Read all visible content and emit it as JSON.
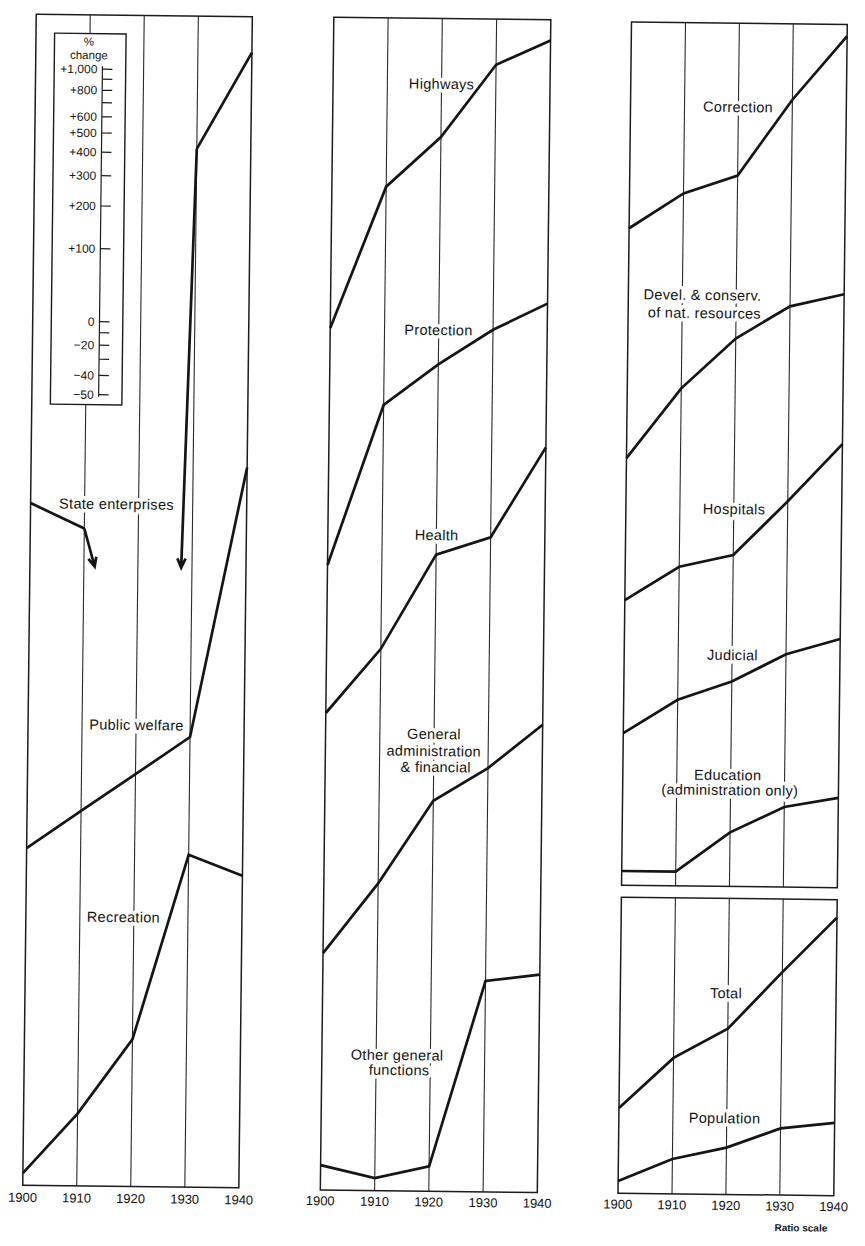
{
  "figure": {
    "ratio_scale_note": "Ratio scale",
    "percent_change_scale": {
      "symbol": "%",
      "title": "change",
      "ticks": [
        {
          "value": 1000,
          "label": "+1,000"
        },
        {
          "value": 900,
          "label": ""
        },
        {
          "value": 800,
          "label": "+800"
        },
        {
          "value": 700,
          "label": ""
        },
        {
          "value": 600,
          "label": "+600"
        },
        {
          "value": 500,
          "label": "+500"
        },
        {
          "value": 400,
          "label": "+400"
        },
        {
          "value": 300,
          "label": "+300"
        },
        {
          "value": 200,
          "label": "+200"
        },
        {
          "value": 100,
          "label": "+100"
        },
        {
          "value": 0,
          "label": "0"
        },
        {
          "value": -10,
          "label": ""
        },
        {
          "value": -20,
          "label": "−20"
        },
        {
          "value": -30,
          "label": ""
        },
        {
          "value": -40,
          "label": "−40"
        },
        {
          "value": -50,
          "label": "−50"
        }
      ]
    },
    "colors": {
      "ink": "#151515",
      "paper": "#ffffff"
    }
  },
  "chart_data": {
    "type": "line",
    "title": "",
    "x": [
      1900,
      1910,
      1920,
      1930,
      1940
    ],
    "x_tick_labels": [
      "1900",
      "1910",
      "1920",
      "1930",
      "1940"
    ],
    "xlabel": "",
    "ylabel": "% change",
    "y_scale": "ratio (logarithmic)",
    "y_unit": "relative level, 1900 = 100 (read from ratio scale)",
    "grid": true,
    "legend": "inline labels beside each line",
    "panels": [
      {
        "name": "left",
        "series": [
          {
            "name": "State enterprises",
            "label_lines": [
              "State enterprises"
            ],
            "values": [
              100,
              79,
              null,
              2940,
              7380
            ],
            "off_scale_below": [
              {
                "from": 1910,
                "toward": 1912
              },
              {
                "from": 1930,
                "toward": 1928
              }
            ]
          },
          {
            "name": "Public welfare",
            "label_lines": [
              "Public welfare"
            ],
            "values": [
              100,
              143,
              204,
              292,
              3800
            ]
          },
          {
            "name": "Recreation",
            "label_lines": [
              "Recreation"
            ],
            "values": [
              100,
              177,
              360,
              2090,
              1725
            ]
          }
        ]
      },
      {
        "name": "middle",
        "series": [
          {
            "name": "Highways",
            "label_lines": [
              "Highways"
            ],
            "values": [
              100,
              385,
              620,
              1240,
              1570
            ]
          },
          {
            "name": "Protection",
            "label_lines": [
              "Protection"
            ],
            "values": [
              100,
              460,
              680,
              950,
              1225
            ]
          },
          {
            "name": "Health",
            "label_lines": [
              "Health"
            ],
            "values": [
              100,
              185,
              455,
              540,
              1275
            ]
          },
          {
            "name": "General administration & financial",
            "label_lines": [
              "General",
              "administration",
              "& financial"
            ],
            "values": [
              100,
              195,
              430,
              590,
              895
            ]
          },
          {
            "name": "Other general functions",
            "label_lines": [
              "Other general",
              "functions"
            ],
            "values": [
              100,
              89,
              100,
              585,
              625
            ]
          }
        ]
      },
      {
        "name": "right-upper",
        "series": [
          {
            "name": "Correction",
            "label_lines": [
              "Correction"
            ],
            "values": [
              100,
              140,
              167,
              345,
              635
            ]
          },
          {
            "name": "Devel. & conserv. of nat. resources",
            "label_lines": [
              "Devel. & conserv.",
              "of nat. resources"
            ],
            "values": [
              100,
              195,
              315,
              430,
              485
            ]
          },
          {
            "name": "Hospitals",
            "label_lines": [
              "Hospitals"
            ],
            "values": [
              100,
              138,
              155,
              260,
              450
            ]
          },
          {
            "name": "Judicial",
            "label_lines": [
              "Judicial"
            ],
            "values": [
              100,
              138,
              165,
              215,
              250
            ]
          },
          {
            "name": "Education (administration only)",
            "label_lines": [
              "Education",
              "(administration only)"
            ],
            "values": [
              100,
              100,
              146,
              187,
              205
            ]
          }
        ]
      },
      {
        "name": "right-lower",
        "series": [
          {
            "name": "Total",
            "label_lines": [
              "Total"
            ],
            "values": [
              100,
              162,
              215,
              370,
              625
            ]
          },
          {
            "name": "Population",
            "label_lines": [
              "Population"
            ],
            "values": [
              100,
              124,
              139,
              168,
              178
            ]
          }
        ]
      }
    ]
  }
}
